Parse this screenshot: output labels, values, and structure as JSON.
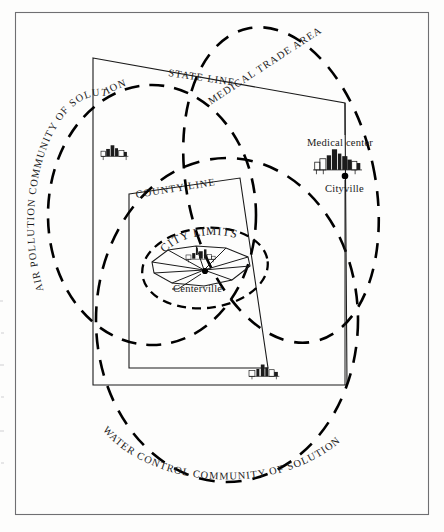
{
  "figure": {
    "kind": "community-of-solution-map",
    "background_color": "#fdfdfc",
    "ink_color": "#1b1b1b",
    "frame_color": "#6f6f72"
  },
  "boundaries": {
    "jurisdictional": [
      {
        "id": "state-line",
        "label": "STATE LINE",
        "style": "solid",
        "shape": "quadrilateral"
      },
      {
        "id": "county-line",
        "label": "COUNTY LINE",
        "style": "solid",
        "shape": "quadrilateral"
      },
      {
        "id": "city-limits",
        "label": "CITY LIMITS",
        "style": "solid",
        "shape": "irregular-polygon"
      }
    ],
    "functional": [
      {
        "id": "air-pollution",
        "label": "AIR POLLUTION COMMUNITY OF SOLUTION",
        "style": "dashed",
        "shape": "ellipse"
      },
      {
        "id": "medical-trade",
        "label": "MEDICAL TRADE AREA",
        "style": "dashed",
        "shape": "ellipse"
      },
      {
        "id": "water-control",
        "label": "WATER CONTROL COMMUNITY OF SOLUTION",
        "style": "dashed",
        "shape": "ellipse"
      },
      {
        "id": "city-limits-ring",
        "label": "CITY LIMITS",
        "style": "dashed",
        "shape": "ellipse"
      }
    ]
  },
  "places": [
    {
      "id": "centerville",
      "name": "Centerville",
      "icon": "city-skyline-icon",
      "marker": "city-dot",
      "inside": "city-limits"
    },
    {
      "id": "cityville",
      "name": "Cityville",
      "caption_above": "Medical center",
      "icon": "city-skyline-icon",
      "marker": "city-dot",
      "inside": "medical-trade"
    },
    {
      "id": "town-northwest",
      "name": "",
      "icon": "city-skyline-icon",
      "marker": "none",
      "inside": "air-pollution"
    },
    {
      "id": "town-south",
      "name": "",
      "icon": "city-skyline-icon",
      "marker": "none",
      "inside": "water-control"
    }
  ],
  "labels": {
    "state_line": "STATE LINE",
    "county_line": "COUNTY LINE",
    "city_limits": "CITY LIMITS",
    "air_pollution": "AIR POLLUTION COMMUNITY OF SOLUTION",
    "medical_trade_area": "MEDICAL TRADE AREA",
    "water_control": "WATER CONTROL COMMUNITY OF SOLUTION",
    "medical_center": "Medical center",
    "centerville": "Centerville",
    "cityville": "Cityville"
  }
}
